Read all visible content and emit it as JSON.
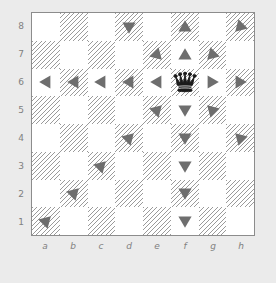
{
  "board": {
    "title": "Chess board with queen move markers",
    "piece": {
      "type": "queen",
      "color": "black",
      "glyph": "♛",
      "square": "f6"
    },
    "colors": {
      "light_square": "#ffffff",
      "dark_square_hatch": "#9a9a9a",
      "marker": "#6e6e6e",
      "piece": "#1a1a1a",
      "border": "#8c8c8c",
      "page_background": "#ebebeb",
      "coordinate_label": "#808080"
    },
    "rank_labels": [
      "8",
      "7",
      "6",
      "5",
      "4",
      "3",
      "2",
      "1"
    ],
    "file_labels": [
      "a",
      "b",
      "c",
      "d",
      "e",
      "f",
      "g",
      "h"
    ],
    "squares": [
      {
        "id": "a8",
        "shade": "light",
        "marker": null
      },
      {
        "id": "b8",
        "shade": "dark",
        "marker": null
      },
      {
        "id": "c8",
        "shade": "light",
        "marker": null
      },
      {
        "id": "d8",
        "shade": "dark",
        "marker": "down"
      },
      {
        "id": "e8",
        "shade": "light",
        "marker": null
      },
      {
        "id": "f8",
        "shade": "dark",
        "marker": "up"
      },
      {
        "id": "g8",
        "shade": "light",
        "marker": null
      },
      {
        "id": "h8",
        "shade": "dark",
        "marker": "down-left"
      },
      {
        "id": "a7",
        "shade": "dark",
        "marker": null
      },
      {
        "id": "b7",
        "shade": "light",
        "marker": null
      },
      {
        "id": "c7",
        "shade": "dark",
        "marker": null
      },
      {
        "id": "d7",
        "shade": "light",
        "marker": null
      },
      {
        "id": "e7",
        "shade": "dark",
        "marker": "down-right"
      },
      {
        "id": "f7",
        "shade": "light",
        "marker": "up"
      },
      {
        "id": "g7",
        "shade": "dark",
        "marker": "down-left"
      },
      {
        "id": "h7",
        "shade": "light",
        "marker": null
      },
      {
        "id": "a6",
        "shade": "light",
        "marker": "left"
      },
      {
        "id": "b6",
        "shade": "dark",
        "marker": "left"
      },
      {
        "id": "c6",
        "shade": "light",
        "marker": "left"
      },
      {
        "id": "d6",
        "shade": "dark",
        "marker": "left"
      },
      {
        "id": "e6",
        "shade": "light",
        "marker": "left"
      },
      {
        "id": "f6",
        "shade": "dark",
        "marker": "queen"
      },
      {
        "id": "g6",
        "shade": "light",
        "marker": "right"
      },
      {
        "id": "h6",
        "shade": "dark",
        "marker": "right"
      },
      {
        "id": "a5",
        "shade": "dark",
        "marker": null
      },
      {
        "id": "b5",
        "shade": "light",
        "marker": null
      },
      {
        "id": "c5",
        "shade": "dark",
        "marker": null
      },
      {
        "id": "d5",
        "shade": "light",
        "marker": null
      },
      {
        "id": "e5",
        "shade": "dark",
        "marker": "up-right"
      },
      {
        "id": "f5",
        "shade": "light",
        "marker": "down"
      },
      {
        "id": "g5",
        "shade": "dark",
        "marker": "up-left"
      },
      {
        "id": "h5",
        "shade": "light",
        "marker": null
      },
      {
        "id": "a4",
        "shade": "light",
        "marker": null
      },
      {
        "id": "b4",
        "shade": "dark",
        "marker": null
      },
      {
        "id": "c4",
        "shade": "light",
        "marker": null
      },
      {
        "id": "d4",
        "shade": "dark",
        "marker": "up-right"
      },
      {
        "id": "e4",
        "shade": "light",
        "marker": null
      },
      {
        "id": "f4",
        "shade": "dark",
        "marker": "down"
      },
      {
        "id": "g4",
        "shade": "light",
        "marker": null
      },
      {
        "id": "h4",
        "shade": "dark",
        "marker": "up-left"
      },
      {
        "id": "a3",
        "shade": "dark",
        "marker": null
      },
      {
        "id": "b3",
        "shade": "light",
        "marker": null
      },
      {
        "id": "c3",
        "shade": "dark",
        "marker": "up-right"
      },
      {
        "id": "d3",
        "shade": "light",
        "marker": null
      },
      {
        "id": "e3",
        "shade": "dark",
        "marker": null
      },
      {
        "id": "f3",
        "shade": "light",
        "marker": "down"
      },
      {
        "id": "g3",
        "shade": "dark",
        "marker": null
      },
      {
        "id": "h3",
        "shade": "light",
        "marker": null
      },
      {
        "id": "a2",
        "shade": "light",
        "marker": null
      },
      {
        "id": "b2",
        "shade": "dark",
        "marker": "up-right"
      },
      {
        "id": "c2",
        "shade": "light",
        "marker": null
      },
      {
        "id": "d2",
        "shade": "dark",
        "marker": null
      },
      {
        "id": "e2",
        "shade": "light",
        "marker": null
      },
      {
        "id": "f2",
        "shade": "dark",
        "marker": "down"
      },
      {
        "id": "g2",
        "shade": "light",
        "marker": null
      },
      {
        "id": "h2",
        "shade": "dark",
        "marker": null
      },
      {
        "id": "a1",
        "shade": "dark",
        "marker": "up-right"
      },
      {
        "id": "b1",
        "shade": "light",
        "marker": null
      },
      {
        "id": "c1",
        "shade": "dark",
        "marker": null
      },
      {
        "id": "d1",
        "shade": "light",
        "marker": null
      },
      {
        "id": "e1",
        "shade": "dark",
        "marker": null
      },
      {
        "id": "f1",
        "shade": "light",
        "marker": "down"
      },
      {
        "id": "g1",
        "shade": "dark",
        "marker": null
      },
      {
        "id": "h1",
        "shade": "light",
        "marker": null
      }
    ]
  }
}
